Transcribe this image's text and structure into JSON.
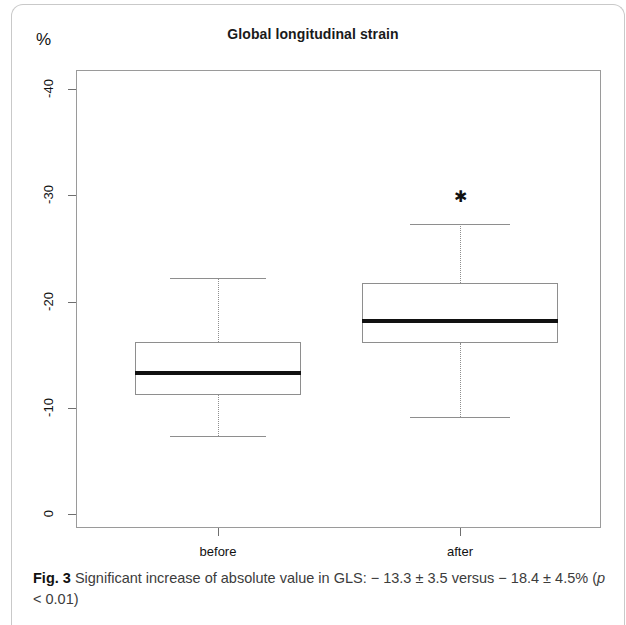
{
  "figure": {
    "label": "Fig. 3",
    "caption_part1": "Significant increase of absolute value in GLS: − 13.3 ± 3.5 versus − 18.4 ± 4.5% (",
    "caption_italic": "p",
    "caption_part2": " < 0.01)"
  },
  "chart_data": {
    "type": "boxplot",
    "title": "Global longitudinal strain",
    "ylabel": "%",
    "xlabel": "",
    "grid": false,
    "legend": null,
    "ylim": [
      0,
      -43
    ],
    "yticks": [
      -40,
      -30,
      -20,
      -10,
      0
    ],
    "ytick_labels": [
      "-40",
      "-30",
      "-20",
      "-10",
      "0"
    ],
    "categories": [
      "before",
      "after"
    ],
    "boxes": [
      {
        "name": "before",
        "whisker_high": -22.2,
        "q3": -16.2,
        "median": -13.3,
        "q1": -11.2,
        "whisker_low": -7.3,
        "outliers": []
      },
      {
        "name": "after",
        "whisker_high": -27.3,
        "q3": -21.7,
        "median": -18.2,
        "q1": -16.1,
        "whisker_low": -9.1,
        "outliers": [
          -29.8
        ]
      }
    ],
    "annotations": {
      "before_mean": "− 13.3 ± 3.5",
      "after_mean": "− 18.4 ± 4.5%",
      "p_value": "p < 0.01"
    },
    "colors": {
      "box_stroke": "#8e8e8e",
      "median": "#111111",
      "frame": "#9a9a9a",
      "text": "#111111"
    }
  }
}
